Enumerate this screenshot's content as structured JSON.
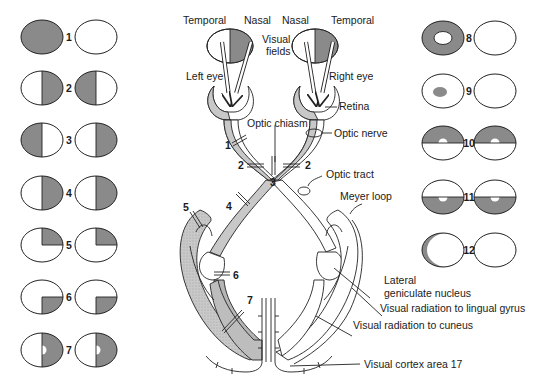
{
  "colors": {
    "shade": "#8a8a8a",
    "fiber": "#c8c8c8",
    "stroke": "#222222"
  },
  "top_labels": {
    "left_temporal": "Temporal",
    "left_nasal": "Nasal",
    "right_nasal": "Nasal",
    "right_temporal": "Temporal",
    "visual_fields_line1": "Visual",
    "visual_fields_line2": "fields",
    "left_eye": "Left eye",
    "right_eye": "Right eye"
  },
  "anatomy_labels": {
    "retina": "Retina",
    "optic_chiasm": "Optic chiasm",
    "optic_nerve": "Optic nerve",
    "optic_tract": "Optic tract",
    "meyer_loop": "Meyer loop",
    "lgn_line1": "Lateral",
    "lgn_line2": "geniculate nucleus",
    "radiation_lingual": "Visual radiation to lingual gyrus",
    "radiation_cuneus": "Visual radiation to cuneus",
    "cortex": "Visual cortex area 17"
  },
  "lesion_markers": [
    "1",
    "2",
    "2",
    "3",
    "4",
    "5",
    "6",
    "7"
  ],
  "field_defects": [
    {
      "id": "1",
      "left": "full",
      "right": "none",
      "description": "Left eye blindness"
    },
    {
      "id": "2",
      "left": "right-half",
      "right": "left-half",
      "description": "Bitemporal hemianopia"
    },
    {
      "id": "3",
      "left": "left-half",
      "right": "right-half",
      "description": "Binasal hemianopia"
    },
    {
      "id": "4",
      "left": "right-half",
      "right": "right-half",
      "description": "Right homonymous hemianopia"
    },
    {
      "id": "5",
      "left": "right-upper-quadrant",
      "right": "right-upper-quadrant",
      "description": "Right upper quadrantanopia"
    },
    {
      "id": "6",
      "left": "right-lower-quadrant",
      "right": "right-lower-quadrant",
      "description": "Right lower quadrantanopia"
    },
    {
      "id": "7",
      "left": "right-half-macular-sparing",
      "right": "right-half-macular-sparing",
      "description": "Right hemianopia with macular sparing"
    },
    {
      "id": "8",
      "left": "central-sparing-ring",
      "right": "none",
      "description": "Left eye field loss with central sparing"
    },
    {
      "id": "9",
      "left": "central-scotoma",
      "right": "none",
      "description": "Left central scotoma"
    },
    {
      "id": "10",
      "left": "upper-half-macular-sparing",
      "right": "upper-half-macular-sparing",
      "description": "Altitudinal upper defect with macular sparing"
    },
    {
      "id": "11",
      "left": "lower-half-macular-sparing",
      "right": "lower-half-macular-sparing",
      "description": "Altitudinal lower defect with macular sparing"
    },
    {
      "id": "12",
      "left": "temporal-crescent",
      "right": "none",
      "description": "Left temporal crescent"
    }
  ]
}
